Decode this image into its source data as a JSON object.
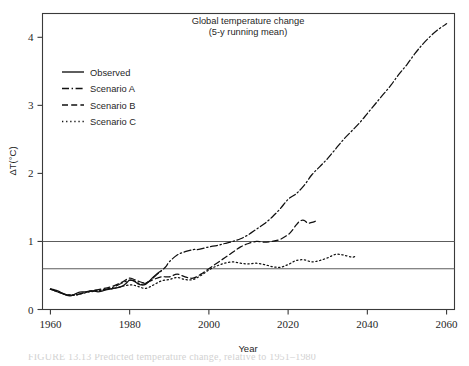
{
  "figure": {
    "caption_fragment": "FIGURE 13.13   Predicted temperature change, relative to 1951–1980"
  },
  "chart_data": {
    "type": "line",
    "title": "Global temperature change",
    "subtitle": "(5-y running mean)",
    "xlabel": "Year",
    "ylabel": "ΔT(°C)",
    "xlim": [
      1958,
      2062
    ],
    "ylim": [
      0,
      4.35
    ],
    "xticks": [
      1960,
      1980,
      2000,
      2020,
      2040,
      2060
    ],
    "yticks": [
      0,
      1,
      2,
      3,
      4
    ],
    "grid": false,
    "legend_position": "upper-left",
    "reference_lines": [
      {
        "label": "1.0",
        "value": 1.0
      },
      {
        "label": "0.6",
        "value": 0.6
      }
    ],
    "legend": [
      {
        "name": "Observed",
        "style": "solid"
      },
      {
        "name": "Scenario A",
        "style": "dash-dot"
      },
      {
        "name": "Scenario B",
        "style": "dashed"
      },
      {
        "name": "Scenario C",
        "style": "dotted"
      }
    ],
    "series": [
      {
        "name": "Observed",
        "style": "solid",
        "x": [
          1960,
          1961,
          1962,
          1963,
          1964,
          1965,
          1966,
          1967,
          1968,
          1969,
          1970,
          1971,
          1972,
          1973,
          1974,
          1975,
          1976,
          1977,
          1978,
          1979,
          1980,
          1981,
          1982,
          1983,
          1984,
          1985,
          1986,
          1987,
          1988
        ],
        "y": [
          0.3,
          0.29,
          0.27,
          0.24,
          0.21,
          0.2,
          0.22,
          0.25,
          0.26,
          0.26,
          0.27,
          0.27,
          0.26,
          0.27,
          0.29,
          0.3,
          0.31,
          0.32,
          0.34,
          0.38,
          0.43,
          0.42,
          0.38,
          0.36,
          0.37,
          0.42,
          0.48,
          0.53,
          0.57
        ]
      },
      {
        "name": "Scenario A",
        "style": "dash-dot",
        "x": [
          1960,
          1965,
          1970,
          1975,
          1980,
          1983,
          1985,
          1987,
          1989,
          1990,
          1992,
          1994,
          1996,
          1997,
          1998,
          2000,
          2002,
          2004,
          2006,
          2008,
          2010,
          2012,
          2014,
          2016,
          2018,
          2020,
          2022,
          2024,
          2026,
          2028,
          2030,
          2032,
          2034,
          2036,
          2038,
          2040,
          2042,
          2044,
          2046,
          2048,
          2050,
          2052,
          2054,
          2056,
          2058,
          2060
        ],
        "y": [
          0.3,
          0.21,
          0.27,
          0.31,
          0.43,
          0.37,
          0.42,
          0.52,
          0.62,
          0.7,
          0.8,
          0.85,
          0.88,
          0.88,
          0.89,
          0.92,
          0.94,
          0.97,
          1.0,
          1.04,
          1.1,
          1.18,
          1.26,
          1.36,
          1.48,
          1.62,
          1.7,
          1.82,
          1.98,
          2.1,
          2.22,
          2.36,
          2.5,
          2.62,
          2.74,
          2.88,
          3.02,
          3.16,
          3.3,
          3.46,
          3.6,
          3.76,
          3.9,
          4.02,
          4.12,
          4.2
        ]
      },
      {
        "name": "Scenario B",
        "style": "dashed",
        "x": [
          1960,
          1965,
          1970,
          1975,
          1978,
          1980,
          1982,
          1984,
          1986,
          1988,
          1990,
          1992,
          1994,
          1996,
          1998,
          2000,
          2002,
          2004,
          2006,
          2008,
          2010,
          2012,
          2014,
          2016,
          2018,
          2020,
          2021,
          2022,
          2023,
          2024,
          2025,
          2026,
          2027
        ],
        "y": [
          0.3,
          0.21,
          0.27,
          0.33,
          0.4,
          0.46,
          0.42,
          0.39,
          0.44,
          0.48,
          0.48,
          0.52,
          0.48,
          0.46,
          0.52,
          0.6,
          0.68,
          0.76,
          0.84,
          0.92,
          0.97,
          1.0,
          0.99,
          1.0,
          1.03,
          1.1,
          1.16,
          1.24,
          1.3,
          1.31,
          1.27,
          1.28,
          1.3
        ]
      },
      {
        "name": "Scenario C",
        "style": "dotted",
        "x": [
          1960,
          1965,
          1970,
          1975,
          1980,
          1982,
          1984,
          1986,
          1988,
          1990,
          1992,
          1994,
          1996,
          1998,
          2000,
          2002,
          2004,
          2006,
          2008,
          2010,
          2012,
          2014,
          2016,
          2018,
          2020,
          2022,
          2024,
          2026,
          2028,
          2030,
          2032,
          2034,
          2036,
          2037
        ],
        "y": [
          0.3,
          0.21,
          0.26,
          0.3,
          0.36,
          0.34,
          0.31,
          0.36,
          0.42,
          0.44,
          0.47,
          0.44,
          0.44,
          0.5,
          0.58,
          0.64,
          0.68,
          0.7,
          0.68,
          0.67,
          0.68,
          0.66,
          0.63,
          0.62,
          0.66,
          0.72,
          0.73,
          0.7,
          0.72,
          0.76,
          0.81,
          0.8,
          0.77,
          0.78
        ]
      }
    ]
  }
}
